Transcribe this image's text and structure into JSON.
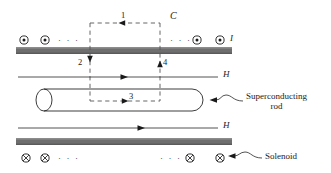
{
  "figure": {
    "background_color": "#ffffff",
    "ink_color": "#1a1a1a",
    "bar_color": "#6e6e6e",
    "dash_color": "#555555",
    "width": 331,
    "height": 173
  },
  "labels": {
    "segment_1": "1",
    "segment_2": "2",
    "segment_3": "3",
    "segment_4": "4",
    "contour": "C",
    "current": "I",
    "field_upper": "H",
    "field_lower": "H",
    "superconducting_rod": "Superconducting",
    "superconducting_rod_line2": "rod",
    "solenoid": "Solenoid",
    "ellipsis": "· · ·"
  },
  "icons": {
    "current_out_of_page": "dot-in-circle-icon",
    "current_into_page": "cross-in-circle-icon",
    "arrow_left": "arrow-left-icon",
    "arrow_right": "arrow-right-icon",
    "arrow_down": "arrow-down-icon",
    "arrow_up": "arrow-up-icon"
  },
  "elements": {
    "top_solenoid_winding_bar": "top-solenoid-bar",
    "bottom_solenoid_winding_bar": "bottom-solenoid-bar",
    "rod": "superconducting-rod-body",
    "amperian_loop": "amperian-loop-dashed-rectangle",
    "upper_field_line": "upper-H-field-line",
    "lower_field_line": "lower-H-field-line"
  },
  "geometry": {
    "loop_left_x": 90,
    "loop_right_x": 160,
    "loop_top_y": 23,
    "loop_bottom_y": 101,
    "top_bar": {
      "x": 16,
      "y": 47,
      "w": 216,
      "h": 7
    },
    "bottom_bar": {
      "x": 16,
      "y": 138,
      "w": 216,
      "h": 7
    },
    "rod": {
      "x": 36,
      "y": 89,
      "w": 167,
      "h": 22
    },
    "upper_H_line_y": 77,
    "lower_H_line_y": 128
  },
  "current_markers_top": [
    {
      "type": "dot-in-circle-icon",
      "x": 24
    },
    {
      "type": "dot-in-circle-icon",
      "x": 45
    },
    {
      "type": "ellipsis",
      "x": 63
    },
    {
      "type": "ellipsis",
      "x": 176
    },
    {
      "type": "dot-in-circle-icon",
      "x": 197
    },
    {
      "type": "dot-in-circle-icon",
      "x": 220
    }
  ],
  "current_markers_bottom": [
    {
      "type": "cross-in-circle-icon",
      "x": 26
    },
    {
      "type": "cross-in-circle-icon",
      "x": 45
    },
    {
      "type": "ellipsis",
      "x": 63
    },
    {
      "type": "ellipsis",
      "x": 165
    },
    {
      "type": "cross-in-circle-icon",
      "x": 190
    },
    {
      "type": "cross-in-circle-icon",
      "x": 220
    }
  ]
}
